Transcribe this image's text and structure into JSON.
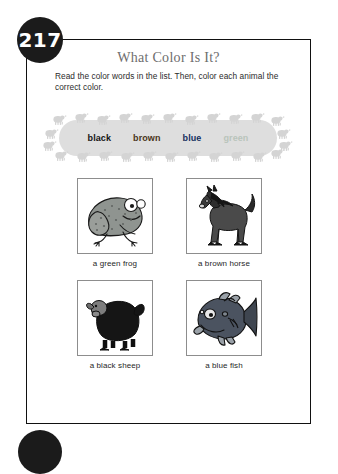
{
  "page": {
    "number": "217",
    "title": "What Color Is It?",
    "instructions": "Read the color words in the list. Then, color each animal the correct color."
  },
  "word_list": {
    "items": [
      {
        "label": "black",
        "color": "#141414"
      },
      {
        "label": "brown",
        "color": "#4a3520"
      },
      {
        "label": "blue",
        "color": "#16305e"
      },
      {
        "label": "green",
        "color": "#b9c4bb"
      }
    ]
  },
  "pictures": [
    {
      "icon": "frog-illustration",
      "caption": "a green frog",
      "fill": "#8f9490"
    },
    {
      "icon": "horse-illustration",
      "caption": "a brown horse",
      "fill": "#4a4a4a"
    },
    {
      "icon": "sheep-illustration",
      "caption": "a black sheep",
      "fill": "#151515"
    },
    {
      "icon": "fish-illustration",
      "caption": "a blue fish",
      "fill": "#4b5360"
    }
  ]
}
